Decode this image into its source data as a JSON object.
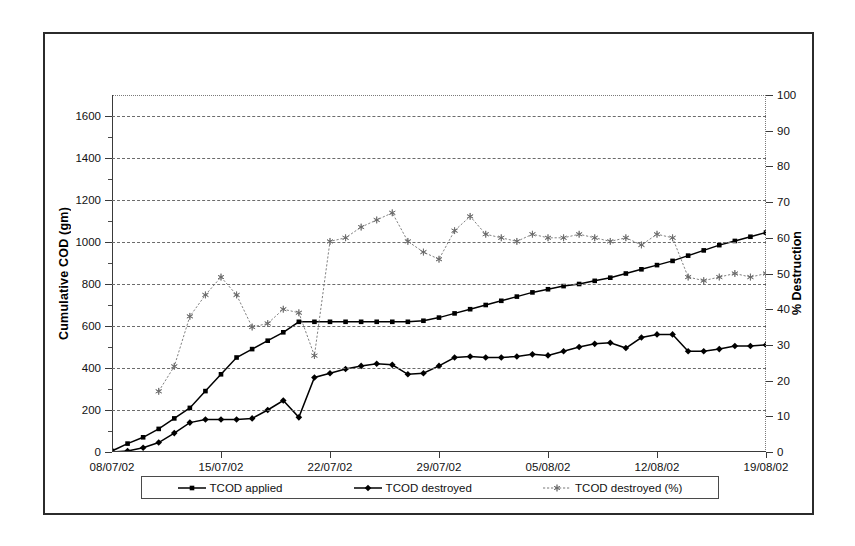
{
  "chart_data": {
    "type": "line",
    "title": "",
    "xlabel": "",
    "ylabel": "Cumulative COD (gm)",
    "y2label": "% Destruction",
    "grid": true,
    "legend_position": "bottom",
    "xlim": [
      0,
      42
    ],
    "ylim": [
      0,
      1700
    ],
    "y2lim": [
      0,
      100
    ],
    "yticks": [
      0,
      200,
      400,
      600,
      800,
      1000,
      1200,
      1400,
      1600
    ],
    "y2ticks": [
      0,
      10,
      20,
      30,
      40,
      50,
      60,
      70,
      80,
      90,
      100
    ],
    "xtick_positions": [
      0,
      7,
      14,
      21,
      28,
      35,
      42
    ],
    "xtick_labels": [
      "08/07/02",
      "15/07/02",
      "22/07/02",
      "29/07/02",
      "05/08/02",
      "12/08/02",
      "19/08/02"
    ],
    "x": [
      0,
      1,
      2,
      3,
      4,
      5,
      6,
      7,
      8,
      9,
      10,
      11,
      12,
      13,
      14,
      15,
      16,
      17,
      18,
      19,
      20,
      21,
      22,
      23,
      24,
      25,
      26,
      27,
      28,
      29,
      30,
      31,
      32,
      33,
      34,
      35,
      36,
      37,
      38,
      39,
      40,
      41,
      42
    ],
    "series": [
      {
        "name": "TCOD applied",
        "axis": "left",
        "marker": "square",
        "color": "#000000",
        "values": [
          5,
          40,
          70,
          110,
          160,
          210,
          290,
          370,
          450,
          490,
          530,
          570,
          620,
          620,
          620,
          620,
          620,
          620,
          620,
          620,
          625,
          640,
          660,
          680,
          700,
          720,
          740,
          760,
          775,
          790,
          800,
          815,
          830,
          850,
          870,
          890,
          910,
          935,
          960,
          985,
          1005,
          1025,
          1045
        ]
      },
      {
        "name": "TCOD destroyed",
        "axis": "left",
        "marker": "diamond",
        "color": "#000000",
        "values": [
          0,
          5,
          20,
          45,
          90,
          140,
          155,
          155,
          155,
          160,
          200,
          245,
          165,
          355,
          375,
          395,
          410,
          420,
          415,
          370,
          375,
          410,
          450,
          455,
          450,
          450,
          455,
          465,
          460,
          480,
          500,
          515,
          520,
          495,
          545,
          560,
          560,
          480,
          480,
          490,
          505,
          505,
          510
        ]
      },
      {
        "name": "TCOD destroyed (%)",
        "axis": "right",
        "marker": "star",
        "color": "#6a6a6a",
        "values": [
          null,
          null,
          null,
          17,
          24,
          38,
          44,
          49,
          44,
          35,
          36,
          40,
          39,
          27,
          59,
          60,
          63,
          65,
          67,
          59,
          56,
          54,
          62,
          66,
          61,
          60,
          59,
          61,
          60,
          60,
          61,
          60,
          59,
          60,
          58,
          61,
          60,
          49,
          48,
          49,
          50,
          49,
          50
        ]
      }
    ]
  },
  "legend": {
    "items": [
      {
        "label": "TCOD applied",
        "marker": "square-marker",
        "color": "#000000"
      },
      {
        "label": "TCOD destroyed",
        "marker": "diamond-marker",
        "color": "#000000"
      },
      {
        "label": "TCOD destroyed (%)",
        "marker": "star-marker",
        "color": "#6a6a6a"
      }
    ]
  }
}
